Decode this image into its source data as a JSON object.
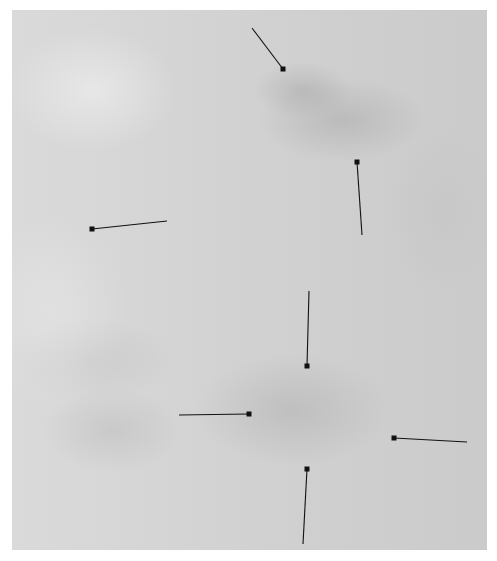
{
  "image": {
    "description": "Grayscale micrograph-like panel with mottled texture and seven black square-tipped pointer annotations",
    "background_color": "#d3d3d3",
    "pointer_color": "#111111"
  },
  "pointers": [
    {
      "id": 1,
      "x1": 252,
      "y1": 28,
      "x2": 283,
      "y2": 69
    },
    {
      "id": 2,
      "x1": 362,
      "y1": 235,
      "x2": 357,
      "y2": 162
    },
    {
      "id": 3,
      "x1": 167,
      "y1": 221,
      "x2": 92,
      "y2": 229
    },
    {
      "id": 4,
      "x1": 309,
      "y1": 291,
      "x2": 307,
      "y2": 366
    },
    {
      "id": 5,
      "x1": 179,
      "y1": 415,
      "x2": 249,
      "y2": 414
    },
    {
      "id": 6,
      "x1": 467,
      "y1": 442,
      "x2": 394,
      "y2": 438
    },
    {
      "id": 7,
      "x1": 303,
      "y1": 544,
      "x2": 307,
      "y2": 469
    }
  ]
}
